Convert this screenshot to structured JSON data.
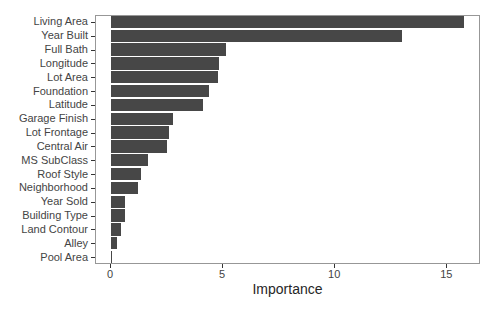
{
  "chart_data": {
    "type": "bar",
    "orientation": "horizontal",
    "title": "",
    "xlabel": "Importance",
    "ylabel": "",
    "categories": [
      "Living Area",
      "Year Built",
      "Full Bath",
      "Longitude",
      "Lot Area",
      "Foundation",
      "Latitude",
      "Garage Finish",
      "Lot Frontage",
      "Central Air",
      "MS SubClass",
      "Roof Style",
      "Neighborhood",
      "Year Sold",
      "Building Type",
      "Land Contour",
      "Alley",
      "Pool Area"
    ],
    "values": [
      15.75,
      13.0,
      5.13,
      4.82,
      4.77,
      4.37,
      4.1,
      2.75,
      2.6,
      2.5,
      1.65,
      1.32,
      1.22,
      0.63,
      0.62,
      0.45,
      0.25,
      0.05
    ],
    "x_ticks": [
      0,
      5,
      10,
      15
    ],
    "xlim": [
      -0.67,
      16.5
    ],
    "grid": false,
    "legend": false,
    "bar_color": "#474747",
    "panel_border_color": "#979797",
    "axis_text_color": "#444444",
    "axis_title_color": "#262626"
  }
}
